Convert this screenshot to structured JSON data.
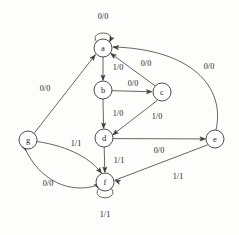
{
  "diagram": {
    "type": "state-transition-graph",
    "nodes": [
      {
        "id": "a",
        "label": "a",
        "cx": 103,
        "cy": 48,
        "r": 9
      },
      {
        "id": "b",
        "label": "b",
        "cx": 103,
        "cy": 90,
        "r": 9
      },
      {
        "id": "c",
        "label": "c",
        "cx": 162,
        "cy": 92,
        "r": 9
      },
      {
        "id": "d",
        "label": "d",
        "cx": 104,
        "cy": 138,
        "r": 9
      },
      {
        "id": "e",
        "label": "e",
        "cx": 215,
        "cy": 139,
        "r": 9
      },
      {
        "id": "f",
        "label": "f",
        "cx": 105,
        "cy": 182,
        "r": 9
      },
      {
        "id": "g",
        "label": "g",
        "cx": 28,
        "cy": 140,
        "r": 9
      }
    ],
    "edges": [
      {
        "id": "a-a",
        "from": "a",
        "to": "a",
        "label": "0/0",
        "label_x": 103,
        "label_y": 16
      },
      {
        "id": "a-b",
        "from": "a",
        "to": "b",
        "label": "1/0",
        "label_x": 118,
        "label_y": 67
      },
      {
        "id": "b-c",
        "from": "b",
        "to": "c",
        "label": "0/0",
        "label_x": 133,
        "label_y": 83
      },
      {
        "id": "b-d",
        "from": "b",
        "to": "d",
        "label": "1/0",
        "label_x": 118,
        "label_y": 113
      },
      {
        "id": "c-a",
        "from": "c",
        "to": "a",
        "label": "0/0",
        "label_x": 146,
        "label_y": 63
      },
      {
        "id": "c-d",
        "from": "c",
        "to": "d",
        "label": "1/0",
        "label_x": 157,
        "label_y": 116
      },
      {
        "id": "d-e",
        "from": "d",
        "to": "e",
        "label": "0/0",
        "label_x": 159,
        "label_y": 150
      },
      {
        "id": "d-f",
        "from": "d",
        "to": "f",
        "label": "1/1",
        "label_x": 119,
        "label_y": 160
      },
      {
        "id": "e-a",
        "from": "e",
        "to": "a",
        "label": "0/0",
        "label_x": 209,
        "label_y": 66
      },
      {
        "id": "e-f",
        "from": "e",
        "to": "f",
        "label": "1/1",
        "label_x": 178,
        "label_y": 176
      },
      {
        "id": "f-f",
        "from": "f",
        "to": "f",
        "label": "1/1",
        "label_x": 105,
        "label_y": 214
      },
      {
        "id": "f-g",
        "from": "f",
        "to": "g",
        "label": "0/0",
        "label_x": 48,
        "label_y": 183
      },
      {
        "id": "g-a",
        "from": "g",
        "to": "a",
        "label": "0/0",
        "label_x": 45,
        "label_y": 88
      },
      {
        "id": "g-f",
        "from": "g",
        "to": "f",
        "label": "1/1",
        "label_x": 76,
        "label_y": 143
      }
    ],
    "geometry": {
      "paths": {
        "a-a": "M 96.5 41.8 C 88 30, 118 30, 109.5 41.8",
        "a-b": "M 103 57 L 103 79.5",
        "b-c": "M 112 90.7 L 150 91.7",
        "b-d": "M 103 99 L 103.6 127.5",
        "c-a": "M 155.2 85.9 L 111 53.6",
        "c-d": "M 157 100.6 L 113.5 134.2",
        "d-e": "M 113 138.6 L 204 138.9",
        "d-f": "M 104.2 147 L 104.8 171.5",
        "e-a": "M 216 130 C 226 86, 190 49, 113.5 47",
        "e-f": "M 207.3 145 L 115.5 180",
        "f-f": "M 98.5 188.5 C 90 201, 120 201, 111.5 188.5",
        "f-g": "M 96.5 185.5 C 70 194, 40 181, 25.5 149.5",
        "g-a": "M 34 133.5 L 95.5 54.5",
        "g-f": "M 36.5 141.5 C 70 146, 92 160, 101 172.5"
      },
      "arrowheads": {
        "a-a": {
          "x": 109.5,
          "y": 41.8,
          "angle": 118
        },
        "a-b": {
          "x": 103,
          "y": 80.5,
          "angle": 90
        },
        "b-c": {
          "x": 152,
          "y": 91.8,
          "angle": 1
        },
        "b-d": {
          "x": 103.6,
          "y": 128.5,
          "angle": 90
        },
        "c-a": {
          "x": 110.6,
          "y": 53.4,
          "angle": 216
        },
        "c-d": {
          "x": 112.7,
          "y": 134.9,
          "angle": 142
        },
        "d-e": {
          "x": 205.5,
          "y": 138.9,
          "angle": 0
        },
        "d-f": {
          "x": 104.8,
          "y": 172.5,
          "angle": 90
        },
        "e-a": {
          "x": 113,
          "y": 47,
          "angle": 186
        },
        "e-f": {
          "x": 114.7,
          "y": 180.3,
          "angle": 201
        },
        "f-f": {
          "x": 98.5,
          "y": 188.5,
          "angle": 63
        },
        "f-g": {
          "x": 25.8,
          "y": 150.5,
          "angle": 66
        },
        "g-a": {
          "x": 95.2,
          "y": 54.9,
          "angle": 308
        },
        "g-f": {
          "x": 101.5,
          "y": 173.3,
          "angle": 53
        }
      }
    }
  },
  "artifacts": {
    "top_smudge": "",
    "bottom_smudge": ""
  }
}
